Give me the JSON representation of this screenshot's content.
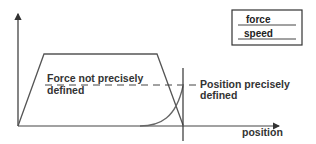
{
  "diagram": {
    "type": "force-speed vs position sketch",
    "axes": {
      "x_label": "position",
      "y_label": ""
    },
    "legend": {
      "items": [
        {
          "label": "force",
          "style": "line"
        },
        {
          "label": "speed",
          "style": "line"
        }
      ]
    },
    "annotations": {
      "force_note_line1": "Force not precisely",
      "force_note_line2": "defined",
      "position_note_line1": "Position precisely",
      "position_note_line2": "defined"
    },
    "colors": {
      "line": "#555555",
      "axis": "#333333",
      "text": "#333333",
      "background": "#ffffff"
    }
  }
}
